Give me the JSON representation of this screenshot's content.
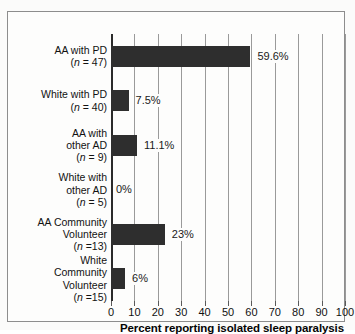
{
  "chart_data": {
    "type": "bar",
    "orientation": "horizontal",
    "title": "",
    "xlabel": "Percent reporting isolated sleep paralysis",
    "ylabel": "",
    "xlim": [
      0,
      100
    ],
    "grid": true,
    "legend": "none",
    "xticks": [
      0,
      10,
      20,
      30,
      40,
      50,
      60,
      70,
      80,
      90,
      100
    ],
    "xtick_labels": [
      "0",
      "10",
      "20",
      "30",
      "40",
      "50",
      "60",
      "70",
      "80",
      "90",
      "100"
    ],
    "categories": [
      "AA with PD (n = 47)",
      "White with PD (n = 40)",
      "AA with other AD (n = 9)",
      "White with other AD (n = 5)",
      "AA Community Volunteer (n =13)",
      "White Community Volunteer (n =15)"
    ],
    "values": [
      59.6,
      7.5,
      11.1,
      0,
      23,
      6
    ],
    "value_labels": [
      "59.6%",
      "7.5%",
      "11.1%",
      "0%",
      "23%",
      "6%"
    ],
    "bar_color": "#2e2e2e",
    "grid_color": "#9a9a9a",
    "axis_color": "#2b2b2b"
  },
  "category_lines": [
    {
      "lines": [
        "AA with PD"
      ],
      "n_prefix": "(",
      "n_text": "n",
      "n_suffix": " = 47)"
    },
    {
      "lines": [
        "White with PD"
      ],
      "n_prefix": "(",
      "n_text": "n",
      "n_suffix": " = 40)"
    },
    {
      "lines": [
        "AA with",
        "other AD"
      ],
      "n_prefix": "(",
      "n_text": "n",
      "n_suffix": " = 9)"
    },
    {
      "lines": [
        "White with",
        "other AD"
      ],
      "n_prefix": "(",
      "n_text": "n",
      "n_suffix": " = 5)"
    },
    {
      "lines": [
        "AA Community",
        "Volunteer"
      ],
      "n_prefix": "(",
      "n_text": "n",
      "n_suffix": " =13)"
    },
    {
      "lines": [
        "White",
        "Community",
        "Volunteer"
      ],
      "n_prefix": "(",
      "n_text": "n",
      "n_suffix": " =15)"
    }
  ]
}
